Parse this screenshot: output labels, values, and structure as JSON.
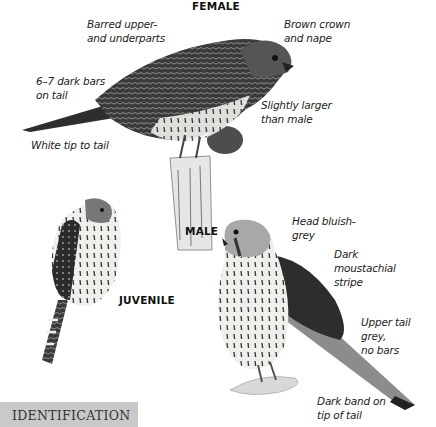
{
  "page": {
    "section_banner": "IDENTIFICATION",
    "accent_colors": {
      "banner_bg": "#c9c9c9",
      "text": "#222222"
    }
  },
  "figures": {
    "female": {
      "heading": "FEMALE",
      "labels": [
        {
          "line1": "Barred upper-",
          "line2": "and underparts"
        },
        {
          "line1": "Brown crown",
          "line2": "and nape"
        },
        {
          "line1": "6–7 dark bars",
          "line2": "on tail"
        },
        {
          "line1": "Slightly larger",
          "line2": "than male"
        },
        {
          "line1": "White tip to tail",
          "line2": ""
        }
      ]
    },
    "juvenile": {
      "heading": "JUVENILE"
    },
    "male": {
      "heading": "MALE",
      "labels": [
        {
          "line1": "Head bluish-",
          "line2": "grey"
        },
        {
          "line1": "Dark",
          "line2": "moustachial",
          "line3": "stripe"
        },
        {
          "line1": "Upper tail grey,",
          "line2": "no bars"
        },
        {
          "line1": "Dark band on",
          "line2": "tip of tail"
        }
      ]
    }
  }
}
